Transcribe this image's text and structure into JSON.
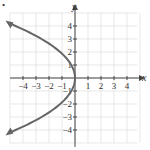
{
  "chart_data": {
    "type": "line",
    "title": "",
    "xlabel": "x",
    "ylabel": "y",
    "xlim": [
      -4.5,
      4.5
    ],
    "ylim": [
      -4.5,
      4.5
    ],
    "grid": true,
    "x_ticks": [
      "-4",
      "-3",
      "-2",
      "-1",
      "1",
      "2",
      "3",
      "4"
    ],
    "y_ticks": [
      "4",
      "3",
      "2",
      "1",
      "-1",
      "-2",
      "-3",
      "-4"
    ],
    "series": [
      {
        "name": "parabola opening left",
        "equation": "x = -y^2/3.5",
        "points": [
          [
            -4.57,
            4
          ],
          [
            -2.57,
            3
          ],
          [
            -1.14,
            2
          ],
          [
            -0.29,
            1
          ],
          [
            0,
            0
          ],
          [
            -0.29,
            -1
          ],
          [
            -1.14,
            -2
          ],
          [
            -2.57,
            -3
          ],
          [
            -4.57,
            -4
          ]
        ],
        "arrows": "both ends",
        "color": "#666666"
      }
    ]
  },
  "marker": "•"
}
